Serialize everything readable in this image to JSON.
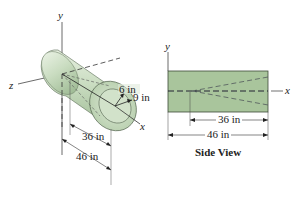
{
  "iso_view": {
    "axes": {
      "x": "x",
      "y": "y",
      "z": "z"
    },
    "inner_radius_label": "6 in",
    "outer_radius_label": "9 in",
    "dim_36_label": "36 in",
    "dim_46_label": "46 in"
  },
  "side_view": {
    "title": "Side View",
    "axes": {
      "x": "x",
      "y": "y"
    },
    "dim_36_label": "36 in",
    "dim_46_label": "46 in"
  },
  "colors": {
    "cylinder_fill": "#c9dcc0",
    "cylinder_shade": "#a9c3a0",
    "side_fill": "#a7c39a",
    "stroke": "#3a3a3a"
  }
}
